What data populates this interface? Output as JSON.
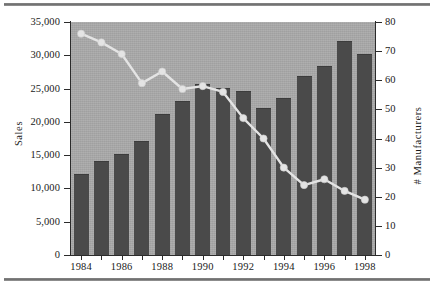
{
  "figure": {
    "top_rule": "horizontal-rule",
    "bottom_rule": "horizontal-rule"
  },
  "chart_data": {
    "type": "bar",
    "title": "",
    "subtitle": "",
    "xlabel": "",
    "ylabel": "Sales",
    "y2label": "# Manufacturers",
    "grid": false,
    "legend": "none",
    "categories": [
      "1984",
      "1985",
      "1986",
      "1987",
      "1988",
      "1989",
      "1990",
      "1991",
      "1992",
      "1993",
      "1994",
      "1995",
      "1996",
      "1997",
      "1998"
    ],
    "x_tick_labels": [
      "1984",
      "1986",
      "1988",
      "1990",
      "1992",
      "1994",
      "1996",
      "1998"
    ],
    "y_tick_labels": [
      "0",
      "5,000",
      "10,000",
      "15,000",
      "20,000",
      "25,000",
      "30,000",
      "35,000"
    ],
    "y2_tick_labels": [
      "0",
      "10",
      "20",
      "30",
      "40",
      "50",
      "60",
      "70",
      "80"
    ],
    "ylim": [
      0,
      35000
    ],
    "y2lim": [
      0,
      80
    ],
    "series": [
      {
        "name": "Sales",
        "type": "bar",
        "axis": "left",
        "color": "#4a4a4a",
        "values": [
          12000,
          14000,
          15000,
          17000,
          21000,
          23000,
          25500,
          25000,
          24500,
          22000,
          23500,
          26800,
          28300,
          32000,
          30000
        ]
      },
      {
        "name": "# Manufacturers",
        "type": "line",
        "axis": "right",
        "color": "#e4e4e4",
        "marker": "circle",
        "values": [
          76,
          73,
          69,
          59,
          63,
          57,
          58,
          56,
          47,
          40,
          30,
          24,
          26,
          22,
          19
        ]
      }
    ]
  }
}
